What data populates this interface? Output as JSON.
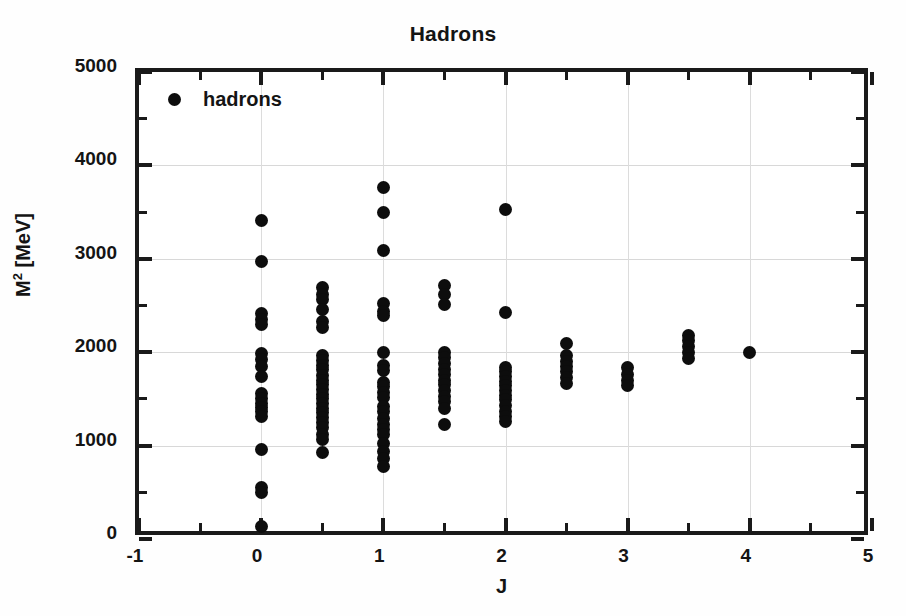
{
  "chart_data": {
    "type": "scatter",
    "title": "Hadrons",
    "xlabel": "J",
    "ylabel": "M² [MeV]",
    "ylabel_base": "M",
    "ylabel_exponent": "2",
    "ylabel_unit": " [MeV]",
    "xlim": [
      -1,
      5
    ],
    "ylim": [
      0,
      5000
    ],
    "xticks": [
      -1,
      0,
      1,
      2,
      3,
      4,
      5
    ],
    "xtick_labels": [
      "-1",
      "0",
      "1",
      "2",
      "3",
      "4",
      "5"
    ],
    "xminor_step": 0.5,
    "yticks": [
      0,
      1000,
      2000,
      3000,
      4000,
      5000
    ],
    "ytick_labels": [
      "0",
      "1000",
      "2000",
      "3000",
      "4000",
      "5000"
    ],
    "yminor_step": 500,
    "grid": true,
    "grid_color": "#d8d8d8",
    "marker_color": "#0d0d0d",
    "marker": "filled-circle",
    "background": "#ffffff",
    "legend": {
      "position": "upper-left-inside",
      "entries": [
        {
          "label": "hadrons",
          "marker": "filled-circle",
          "color": "#0d0d0d"
        }
      ]
    },
    "series": [
      {
        "name": "hadrons",
        "points": [
          {
            "x": 0,
            "y": 3405
          },
          {
            "x": 0,
            "y": 2975
          },
          {
            "x": 0,
            "y": 2410
          },
          {
            "x": 0,
            "y": 2345
          },
          {
            "x": 0,
            "y": 2300
          },
          {
            "x": 0,
            "y": 1985
          },
          {
            "x": 0,
            "y": 1925
          },
          {
            "x": 0,
            "y": 1850
          },
          {
            "x": 0,
            "y": 1745
          },
          {
            "x": 0,
            "y": 1560
          },
          {
            "x": 0,
            "y": 1500
          },
          {
            "x": 0,
            "y": 1455
          },
          {
            "x": 0,
            "y": 1410
          },
          {
            "x": 0,
            "y": 1370
          },
          {
            "x": 0,
            "y": 1310
          },
          {
            "x": 0,
            "y": 960
          },
          {
            "x": 0,
            "y": 555
          },
          {
            "x": 0,
            "y": 495
          },
          {
            "x": 0,
            "y": 135
          },
          {
            "x": 0.5,
            "y": 2690
          },
          {
            "x": 0.5,
            "y": 2620
          },
          {
            "x": 0.5,
            "y": 2565
          },
          {
            "x": 0.5,
            "y": 2460
          },
          {
            "x": 0.5,
            "y": 2330
          },
          {
            "x": 0.5,
            "y": 2260
          },
          {
            "x": 0.5,
            "y": 1960
          },
          {
            "x": 0.5,
            "y": 1910
          },
          {
            "x": 0.5,
            "y": 1860
          },
          {
            "x": 0.5,
            "y": 1810
          },
          {
            "x": 0.5,
            "y": 1750
          },
          {
            "x": 0.5,
            "y": 1700
          },
          {
            "x": 0.5,
            "y": 1655
          },
          {
            "x": 0.5,
            "y": 1600
          },
          {
            "x": 0.5,
            "y": 1550
          },
          {
            "x": 0.5,
            "y": 1500
          },
          {
            "x": 0.5,
            "y": 1450
          },
          {
            "x": 0.5,
            "y": 1400
          },
          {
            "x": 0.5,
            "y": 1350
          },
          {
            "x": 0.5,
            "y": 1300
          },
          {
            "x": 0.5,
            "y": 1245
          },
          {
            "x": 0.5,
            "y": 1190
          },
          {
            "x": 0.5,
            "y": 1120
          },
          {
            "x": 0.5,
            "y": 1060
          },
          {
            "x": 0.5,
            "y": 930
          },
          {
            "x": 1,
            "y": 3760
          },
          {
            "x": 1,
            "y": 3500
          },
          {
            "x": 1,
            "y": 3085
          },
          {
            "x": 1,
            "y": 2520
          },
          {
            "x": 1,
            "y": 2440
          },
          {
            "x": 1,
            "y": 2395
          },
          {
            "x": 1,
            "y": 2000
          },
          {
            "x": 1,
            "y": 1860
          },
          {
            "x": 1,
            "y": 1805
          },
          {
            "x": 1,
            "y": 1680
          },
          {
            "x": 1,
            "y": 1630
          },
          {
            "x": 1,
            "y": 1570
          },
          {
            "x": 1,
            "y": 1510
          },
          {
            "x": 1,
            "y": 1420
          },
          {
            "x": 1,
            "y": 1370
          },
          {
            "x": 1,
            "y": 1290
          },
          {
            "x": 1,
            "y": 1230
          },
          {
            "x": 1,
            "y": 1175
          },
          {
            "x": 1,
            "y": 1115
          },
          {
            "x": 1,
            "y": 1020
          },
          {
            "x": 1,
            "y": 940
          },
          {
            "x": 1,
            "y": 860
          },
          {
            "x": 1,
            "y": 775
          },
          {
            "x": 1.5,
            "y": 2710
          },
          {
            "x": 1.5,
            "y": 2620
          },
          {
            "x": 1.5,
            "y": 2510
          },
          {
            "x": 1.5,
            "y": 2000
          },
          {
            "x": 1.5,
            "y": 1940
          },
          {
            "x": 1.5,
            "y": 1880
          },
          {
            "x": 1.5,
            "y": 1820
          },
          {
            "x": 1.5,
            "y": 1760
          },
          {
            "x": 1.5,
            "y": 1700
          },
          {
            "x": 1.5,
            "y": 1650
          },
          {
            "x": 1.5,
            "y": 1590
          },
          {
            "x": 1.5,
            "y": 1530
          },
          {
            "x": 1.5,
            "y": 1470
          },
          {
            "x": 1.5,
            "y": 1395
          },
          {
            "x": 1.5,
            "y": 1225
          },
          {
            "x": 2,
            "y": 3525
          },
          {
            "x": 2,
            "y": 2430
          },
          {
            "x": 2,
            "y": 1840
          },
          {
            "x": 2,
            "y": 1790
          },
          {
            "x": 2,
            "y": 1740
          },
          {
            "x": 2,
            "y": 1690
          },
          {
            "x": 2,
            "y": 1640
          },
          {
            "x": 2,
            "y": 1590
          },
          {
            "x": 2,
            "y": 1540
          },
          {
            "x": 2,
            "y": 1490
          },
          {
            "x": 2,
            "y": 1430
          },
          {
            "x": 2,
            "y": 1370
          },
          {
            "x": 2,
            "y": 1310
          },
          {
            "x": 2,
            "y": 1255
          },
          {
            "x": 2.5,
            "y": 2090
          },
          {
            "x": 2.5,
            "y": 1960
          },
          {
            "x": 2.5,
            "y": 1900
          },
          {
            "x": 2.5,
            "y": 1845
          },
          {
            "x": 2.5,
            "y": 1790
          },
          {
            "x": 2.5,
            "y": 1730
          },
          {
            "x": 2.5,
            "y": 1665
          },
          {
            "x": 3,
            "y": 1840
          },
          {
            "x": 3,
            "y": 1760
          },
          {
            "x": 3,
            "y": 1700
          },
          {
            "x": 3,
            "y": 1645
          },
          {
            "x": 3.5,
            "y": 2180
          },
          {
            "x": 3.5,
            "y": 2120
          },
          {
            "x": 3.5,
            "y": 2060
          },
          {
            "x": 3.5,
            "y": 2000
          },
          {
            "x": 3.5,
            "y": 1935
          },
          {
            "x": 4,
            "y": 2000
          }
        ]
      }
    ]
  }
}
